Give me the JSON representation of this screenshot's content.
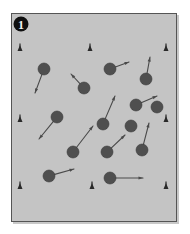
{
  "figure": {
    "domain_kind": "scientific-figure-panel",
    "canvas_width": 190,
    "canvas_height": 234,
    "page_background": "#ffffff",
    "panel": {
      "x": 11,
      "y": 13,
      "width": 166,
      "height": 209,
      "fill": "#c4c4c4",
      "stroke": "#555555",
      "stroke_width": 1,
      "shadow_color": "#9a9a9a"
    },
    "panel_label": {
      "text": "1",
      "marker_shape": "filled-circle",
      "cx": 21,
      "cy": 24,
      "r": 7.5,
      "circle_fill": "#101010",
      "text_fill": "#f2f2f2"
    },
    "colors": {
      "particle_fill": "#4f4f4f",
      "particle_stroke": "#3a3a3a",
      "vector_stroke": "#4a4a4a",
      "edge_marker_fill": "#2a2a2a",
      "panel_background": "#c4c4c4"
    },
    "geometry": {
      "particle_radius": 6.0,
      "vector_stroke_width": 1.1,
      "arrowhead_length": 4.5,
      "arrowhead_width": 3.2
    },
    "edge_markers": {
      "label": "edge reference markers",
      "shape": "small-upward-triangle",
      "width": 5,
      "height": 6,
      "count": 8,
      "points": [
        {
          "x": 20,
          "y": 51,
          "row": "top",
          "col": "left"
        },
        {
          "x": 90,
          "y": 51,
          "row": "top",
          "col": "center"
        },
        {
          "x": 166,
          "y": 51,
          "row": "top",
          "col": "right"
        },
        {
          "x": 20,
          "y": 122,
          "row": "middle",
          "col": "left"
        },
        {
          "x": 166,
          "y": 122,
          "row": "middle",
          "col": "right"
        },
        {
          "x": 20,
          "y": 189,
          "row": "bottom",
          "col": "left"
        },
        {
          "x": 92,
          "y": 189,
          "row": "bottom",
          "col": "center"
        },
        {
          "x": 166,
          "y": 189,
          "row": "bottom",
          "col": "right"
        }
      ]
    },
    "particles": {
      "label": "tracked particles with displacement vectors",
      "count": 14,
      "items": [
        {
          "id": 1,
          "cx": 44,
          "cy": 69,
          "tip_x": 35,
          "tip_y": 93
        },
        {
          "id": 2,
          "cx": 84,
          "cy": 88,
          "tip_x": 71,
          "tip_y": 74
        },
        {
          "id": 3,
          "cx": 110,
          "cy": 69,
          "tip_x": 129,
          "tip_y": 62
        },
        {
          "id": 4,
          "cx": 146,
          "cy": 79,
          "tip_x": 150,
          "tip_y": 57
        },
        {
          "id": 5,
          "cx": 136,
          "cy": 105,
          "tip_x": 157,
          "tip_y": 96
        },
        {
          "id": 6,
          "cx": 57,
          "cy": 117,
          "tip_x": 39,
          "tip_y": 139
        },
        {
          "id": 7,
          "cx": 103,
          "cy": 124,
          "tip_x": 115,
          "tip_y": 96
        },
        {
          "id": 8,
          "cx": 73,
          "cy": 152,
          "tip_x": 93,
          "tip_y": 126
        },
        {
          "id": 9,
          "cx": 107,
          "cy": 152,
          "tip_x": 125,
          "tip_y": 135
        },
        {
          "id": 10,
          "cx": 142,
          "cy": 150,
          "tip_x": 149,
          "tip_y": 123
        },
        {
          "id": 11,
          "cx": 49,
          "cy": 176,
          "tip_x": 74,
          "tip_y": 169
        },
        {
          "id": 12,
          "cx": 110,
          "cy": 178,
          "tip_x": 143,
          "tip_y": 178
        },
        {
          "id": 13,
          "cx": 131,
          "cy": 126,
          "tip_x": 131,
          "tip_y": 126
        },
        {
          "id": 14,
          "cx": 157,
          "cy": 107,
          "tip_x": 157,
          "tip_y": 107
        }
      ]
    }
  }
}
